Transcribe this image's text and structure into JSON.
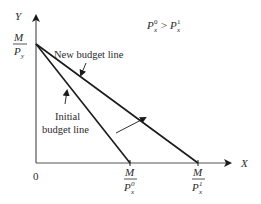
{
  "diagram": {
    "type": "budget-line-shift",
    "colors": {
      "line": "#1a1a1a",
      "axis": "#333333",
      "text": "#2a2a2a",
      "background": "#ffffff"
    },
    "axes": {
      "y_label": "Y",
      "x_label": "X",
      "origin_label": "0"
    },
    "y_intercept": {
      "numerator": "M",
      "denominator": "P",
      "subscript": "y"
    },
    "x_intercepts": [
      {
        "numerator": "M",
        "denominator": "P",
        "subscript": "x",
        "superscript": "0"
      },
      {
        "numerator": "M",
        "denominator": "P",
        "subscript": "x",
        "superscript": "1"
      }
    ],
    "annotations": {
      "new_budget_line": "New budget line",
      "initial_line_1": "Initial",
      "initial_line_2": "budget line"
    },
    "condition": {
      "left_base": "P",
      "left_sup": "0",
      "left_sub": "x",
      "operator": ">",
      "right_base": "P",
      "right_sup": "1",
      "right_sub": "x"
    },
    "lines": [
      {
        "name": "Initial budget line",
        "from": [
          0,
          "M/Py"
        ],
        "to": [
          "M/Px0",
          0
        ]
      },
      {
        "name": "New budget line",
        "from": [
          0,
          "M/Py"
        ],
        "to": [
          "M/Px1",
          0
        ]
      }
    ]
  }
}
